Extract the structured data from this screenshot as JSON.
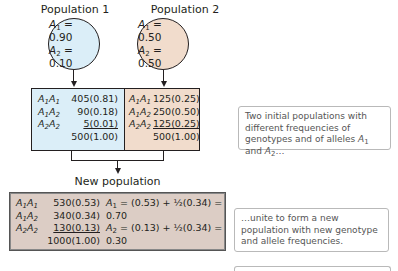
{
  "populations": [
    {
      "title": "Population 1",
      "alleles": [
        {
          "name": "A",
          "sub": "1",
          "eq": " = 0.90"
        },
        {
          "name": "A",
          "sub": "2",
          "eq": " = 0.10"
        }
      ],
      "genotypes": [
        {
          "g1": "A",
          "s1": "1",
          "g2": "A",
          "s2": "1",
          "value": "405(0.81)"
        },
        {
          "g1": "A",
          "s1": "1",
          "g2": "A",
          "s2": "2",
          "value": "90(0.18)"
        },
        {
          "g1": "A",
          "s1": "2",
          "g2": "A",
          "s2": "2",
          "value": "5(0.01)"
        }
      ],
      "total": "500(1.00)"
    },
    {
      "title": "Population 2",
      "alleles": [
        {
          "name": "A",
          "sub": "1",
          "eq": " = 0.50"
        },
        {
          "name": "A",
          "sub": "2",
          "eq": " = 0.50"
        }
      ],
      "genotypes": [
        {
          "g1": "A",
          "s1": "1",
          "g2": "A",
          "s2": "1",
          "value": "125(0.25)"
        },
        {
          "g1": "A",
          "s1": "1",
          "g2": "A",
          "s2": "2",
          "value": "250(0.50)"
        },
        {
          "g1": "A",
          "s1": "2",
          "g2": "A",
          "s2": "2",
          "value": "125(0.25)"
        }
      ],
      "total": "500(1.00)"
    }
  ],
  "new_population": {
    "title": "New population",
    "genotypes": [
      {
        "g1": "A",
        "s1": "1",
        "g2": "A",
        "s2": "1",
        "value": "530(0.53)"
      },
      {
        "g1": "A",
        "s1": "1",
        "g2": "A",
        "s2": "2",
        "value": "340(0.34)"
      },
      {
        "g1": "A",
        "s1": "2",
        "g2": "A",
        "s2": "2",
        "value": "130(0.13)"
      }
    ],
    "total": "1000(1.00)",
    "equations": [
      {
        "name": "A",
        "sub": "1",
        "eq": " = (0.53) + ½(0.34) = 0.70"
      },
      {
        "name": "A",
        "sub": "2",
        "eq": " = (0.13) + ½(0.34) = 0.30"
      }
    ]
  },
  "notes": {
    "note1_text": "Two initial populations with different frequencies of genotypes and of alleles ",
    "note1_a": "A",
    "note1_s1": "1",
    "note1_and": " and ",
    "note1_b": "A",
    "note1_s2": "2",
    "note1_end": "…",
    "note2_text": "…unite to form a new population with new genotype and allele frequencies."
  },
  "colors": {
    "pop1_fill": "#dbeef8",
    "pop2_fill": "#f1dccc",
    "new_fill": "#dccdc5"
  }
}
